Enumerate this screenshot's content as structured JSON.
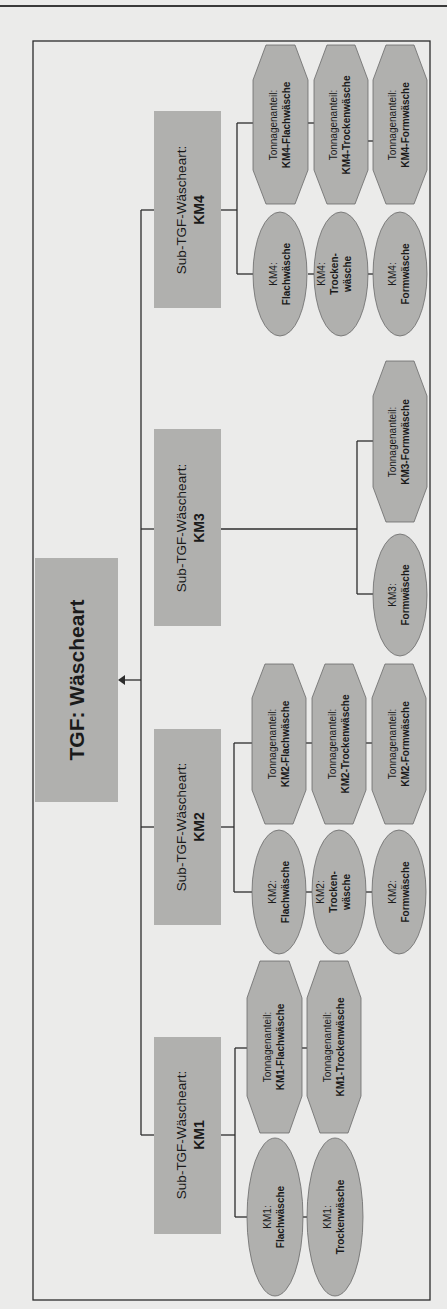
{
  "colors": {
    "background": "#ebebea",
    "box_fill": "#b0b0ae",
    "line": "#2c2c2c",
    "text": "#1a1a1a"
  },
  "root": {
    "label": "TGF: Wäscheart"
  },
  "subgroups": [
    {
      "id": "KM4",
      "title": "Sub-TGF-Wäscheart:",
      "code": "KM4",
      "ellipses": [
        {
          "line1": "KM4:",
          "line2": "Flachwäsche",
          "line3": ""
        },
        {
          "line1": "KM4:",
          "line2": "Trocken-",
          "line3": "wäsche"
        },
        {
          "line1": "KM4:",
          "line2": "Formwäsche",
          "line3": ""
        }
      ],
      "octagons": [
        {
          "line1": "Tonnagenanteil:",
          "line2": "KM4-Flachwäsche"
        },
        {
          "line1": "Tonnagenanteil:",
          "line2": "KM4-Trockenwäsche"
        },
        {
          "line1": "Tonnagenanteil:",
          "line2": "KM4-Formwäsche"
        }
      ]
    },
    {
      "id": "KM3",
      "title": "Sub-TGF-Wäscheart:",
      "code": "KM3",
      "ellipses": [
        {
          "line1": "KM3:",
          "line2": "Formwäsche",
          "line3": ""
        }
      ],
      "octagons": [
        {
          "line1": "Tonnagenanteil:",
          "line2": "KM3-Formwäsche"
        }
      ]
    },
    {
      "id": "KM2",
      "title": "Sub-TGF-Wäscheart:",
      "code": "KM2",
      "ellipses": [
        {
          "line1": "KM2:",
          "line2": "Flachwäsche",
          "line3": ""
        },
        {
          "line1": "KM2:",
          "line2": "Trocken-",
          "line3": "wäsche"
        },
        {
          "line1": "KM2:",
          "line2": "Formwäsche",
          "line3": ""
        }
      ],
      "octagons": [
        {
          "line1": "Tonnagenanteil:",
          "line2": "KM2-Flachwäsche"
        },
        {
          "line1": "Tonnagenanteil:",
          "line2": "KM2-Trockenwäsche"
        },
        {
          "line1": "Tonnagenanteil:",
          "line2": "KM2-Formwäsche"
        }
      ]
    },
    {
      "id": "KM1",
      "title": "Sub-TGF-Wäscheart:",
      "code": "KM1",
      "ellipses": [
        {
          "line1": "KM1:",
          "line2": "Flachwäsche",
          "line3": ""
        },
        {
          "line1": "KM1:",
          "line2": "Trockenwäsche",
          "line3": ""
        }
      ],
      "octagons": [
        {
          "line1": "Tonnagenanteil:",
          "line2": "KM1-Flachwäsche"
        },
        {
          "line1": "Tonnagenanteil:",
          "line2": "KM1-Trockenwäsche"
        }
      ]
    }
  ]
}
